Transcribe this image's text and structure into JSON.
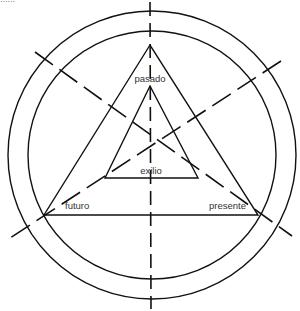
{
  "page": {
    "top_fragment": "......"
  },
  "diagram": {
    "type": "concentric circles with nested triangles and dashed axes",
    "colors": {
      "line": "#111111",
      "text": "#333333",
      "background": "#ffffff"
    },
    "circles": [
      {
        "name": "outer-circle",
        "cx": 152,
        "cy": 155,
        "r": 144
      },
      {
        "name": "inner-circle",
        "cx": 152,
        "cy": 155,
        "r": 124
      }
    ],
    "outer_triangle": {
      "points": "150,45 44,215 258,215"
    },
    "inner_triangle": {
      "points": "150,86 105,178 198,178"
    },
    "axes": [
      {
        "name": "vertical-axis",
        "x1": 150,
        "y1": 2,
        "x2": 151,
        "y2": 309,
        "dash": "14 7"
      },
      {
        "name": "diagonal-axis-left",
        "x1": 35,
        "y1": 52,
        "x2": 292,
        "y2": 236,
        "dash": "22 8"
      },
      {
        "name": "diagonal-axis-right",
        "x1": 281,
        "y1": 61,
        "x2": 10,
        "y2": 238,
        "dash": "22 8"
      }
    ],
    "labels": {
      "pasado": "pasado",
      "exilio": "exilio",
      "futuro": "futuro",
      "presente": "presente"
    }
  }
}
